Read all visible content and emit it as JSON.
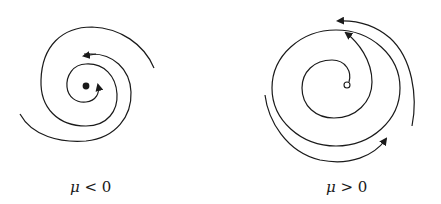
{
  "figure": {
    "panels": [
      {
        "id": "left",
        "symbol": "μ",
        "relation": " < 0",
        "fixed_point": "stable (filled)",
        "flow": "spiral inward"
      },
      {
        "id": "right",
        "symbol": "μ",
        "relation": " > 0",
        "fixed_point": "unstable (open)",
        "flow": "spiral outward to limit cycle"
      }
    ],
    "colors": {
      "stroke": "#1a1a1a",
      "background": "#ffffff"
    }
  }
}
